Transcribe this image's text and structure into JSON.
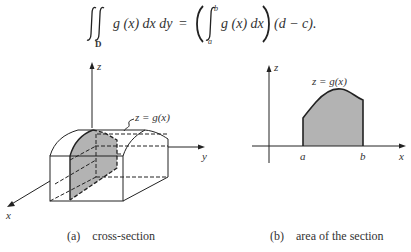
{
  "formula": {
    "lhs_integrand": "g (x) dx dy",
    "region_label": "D",
    "equals": "=",
    "rhs_integrand": "g (x) dx",
    "lower_limit": "a",
    "upper_limit": "b",
    "factor": "(d − c)."
  },
  "figure_a": {
    "axis_labels": {
      "x": "x",
      "y": "y",
      "z": "z"
    },
    "curve_label": "z = g(x)",
    "caption_tag": "(a)",
    "caption_text": "cross-section",
    "shade_color": "#b3b3b3"
  },
  "figure_b": {
    "axis_labels": {
      "x": "x",
      "z": "z"
    },
    "curve_label": "z = g(x)",
    "interval_start_label": "a",
    "interval_end_label": "b",
    "caption_tag": "(b)",
    "caption_text": "area of the section",
    "shade_color": "#b3b3b3"
  }
}
